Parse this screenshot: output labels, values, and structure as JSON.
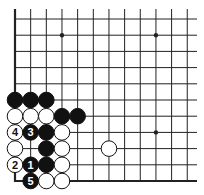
{
  "diagram": {
    "type": "go-board-partial",
    "visible_columns": 12,
    "visible_rows": 11,
    "edges": [
      "left",
      "bottom"
    ],
    "colors": {
      "background": "#ffffff",
      "line": "#222222",
      "black_stone": "#111111",
      "white_stone": "#ffffff",
      "stone_outline": "#111111"
    },
    "star_points": [
      {
        "col": 3,
        "row": 1
      },
      {
        "col": 9,
        "row": 1
      },
      {
        "col": 9,
        "row": 7
      }
    ],
    "stones": [
      {
        "col": 0,
        "row": 5,
        "color": "black",
        "label": ""
      },
      {
        "col": 1,
        "row": 5,
        "color": "black",
        "label": ""
      },
      {
        "col": 2,
        "row": 5,
        "color": "black",
        "label": ""
      },
      {
        "col": 0,
        "row": 6,
        "color": "white",
        "label": ""
      },
      {
        "col": 1,
        "row": 6,
        "color": "white",
        "label": ""
      },
      {
        "col": 2,
        "row": 6,
        "color": "white",
        "label": ""
      },
      {
        "col": 3,
        "row": 6,
        "color": "black",
        "label": ""
      },
      {
        "col": 4,
        "row": 6,
        "color": "black",
        "label": ""
      },
      {
        "col": 0,
        "row": 7,
        "color": "white",
        "label": "4"
      },
      {
        "col": 1,
        "row": 7,
        "color": "black",
        "label": "3"
      },
      {
        "col": 2,
        "row": 7,
        "color": "black",
        "label": ""
      },
      {
        "col": 3,
        "row": 7,
        "color": "white",
        "label": ""
      },
      {
        "col": 0,
        "row": 8,
        "color": "white",
        "label": ""
      },
      {
        "col": 2,
        "row": 8,
        "color": "black",
        "label": ""
      },
      {
        "col": 3,
        "row": 8,
        "color": "white",
        "label": ""
      },
      {
        "col": 6,
        "row": 8,
        "color": "white",
        "label": ""
      },
      {
        "col": 0,
        "row": 9,
        "color": "white",
        "label": "2"
      },
      {
        "col": 1,
        "row": 9,
        "color": "black",
        "label": "1"
      },
      {
        "col": 2,
        "row": 9,
        "color": "black",
        "label": ""
      },
      {
        "col": 3,
        "row": 9,
        "color": "white",
        "label": ""
      },
      {
        "col": 1,
        "row": 10,
        "color": "black",
        "label": "5"
      },
      {
        "col": 2,
        "row": 10,
        "color": "white",
        "label": ""
      },
      {
        "col": 3,
        "row": 10,
        "color": "white",
        "label": ""
      }
    ]
  }
}
